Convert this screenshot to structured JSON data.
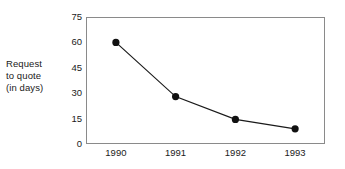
{
  "chart_data": {
    "type": "line",
    "title": "",
    "subtitle": "",
    "xlabel": "",
    "ylabel": "Request to quote (in days)",
    "ylabel_lines": [
      "Request",
      "to quote",
      "(in days)"
    ],
    "categories": [
      "1990",
      "1991",
      "1992",
      "1993"
    ],
    "values": [
      60,
      28,
      14.5,
      9
    ],
    "series": [
      {
        "name": "Request to quote (in days)",
        "values": [
          60,
          28,
          14.5,
          9
        ]
      }
    ],
    "x": [
      1990,
      1991,
      1992,
      1993
    ],
    "ylim": [
      0,
      75
    ],
    "yticks": [
      0,
      15,
      30,
      45,
      60,
      75
    ],
    "ytick_labels": [
      "0",
      "15",
      "30",
      "45",
      "60",
      "75"
    ],
    "xtick_labels": [
      "1990",
      "1991",
      "1992",
      "1993"
    ],
    "grid": false,
    "legend": false,
    "legend_position": "none",
    "marker": "filled-circle",
    "colors": {
      "line": "#1a1a1a",
      "marker": "#111111",
      "frame": "#8a8a8a",
      "background": "#ffffff",
      "text": "#1a1a1a"
    }
  }
}
